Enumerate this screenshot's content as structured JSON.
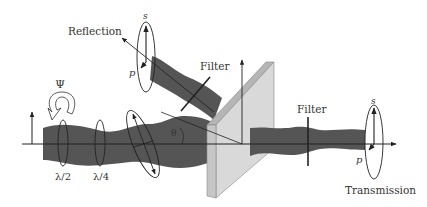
{
  "diagram": {
    "labels": {
      "reflection": "Reflection",
      "transmission": "Transmission",
      "filter_reflection": "Filter",
      "filter_transmission": "Filter",
      "half_wave": "λ/2",
      "quarter_wave": "λ/4",
      "psi": "Ψ",
      "theta": "θ",
      "s_reflection": "s",
      "p_reflection": "p",
      "s_transmission": "s",
      "p_transmission": "p"
    },
    "colors": {
      "beam": "#555555",
      "plate_face": "#d9d9d9",
      "plate_edge": "#b5b5b5",
      "line": "#222222",
      "background": "#ffffff"
    }
  }
}
